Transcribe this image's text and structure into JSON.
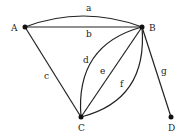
{
  "graph": {
    "nodes": [
      {
        "id": "A",
        "label": "A"
      },
      {
        "id": "B",
        "label": "B"
      },
      {
        "id": "C",
        "label": "C"
      },
      {
        "id": "D",
        "label": "D"
      }
    ],
    "edges": [
      {
        "id": "a",
        "label": "a",
        "from": "A",
        "to": "B",
        "shape": "curve"
      },
      {
        "id": "b",
        "label": "b",
        "from": "A",
        "to": "B",
        "shape": "straight"
      },
      {
        "id": "c",
        "label": "c",
        "from": "A",
        "to": "C",
        "shape": "straight"
      },
      {
        "id": "d",
        "label": "d",
        "from": "C",
        "to": "B",
        "shape": "curve"
      },
      {
        "id": "e",
        "label": "e",
        "from": "C",
        "to": "B",
        "shape": "straight"
      },
      {
        "id": "f",
        "label": "f",
        "from": "C",
        "to": "B",
        "shape": "curve"
      },
      {
        "id": "g",
        "label": "g",
        "from": "B",
        "to": "D",
        "shape": "straight"
      }
    ]
  },
  "colors": {
    "stroke": "#222222",
    "node": "#111111",
    "background": "#ffffff"
  }
}
